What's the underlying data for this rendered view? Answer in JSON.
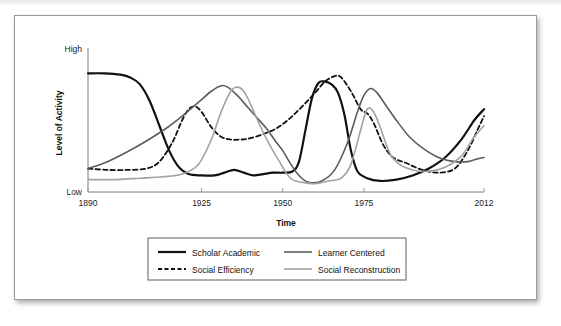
{
  "figure": {
    "background_color": "#ffffff",
    "border_color": "#9b9b9b"
  },
  "chart_data": {
    "type": "line",
    "title": "",
    "xlabel": "Time",
    "ylabel": "Level of Activity",
    "grid": false,
    "legend_position": "bottom",
    "x_tick_labels": [
      "1890",
      "1925",
      "1950",
      "1975",
      "2012"
    ],
    "x_tick_values": [
      1890,
      1925,
      1950,
      1975,
      2012
    ],
    "xlim": [
      1890,
      2012
    ],
    "y_tick_labels": [
      "Low",
      "High"
    ],
    "ylim": [
      0,
      1
    ],
    "y_axis_note": "qualitative scale from Low to High",
    "series": [
      {
        "name": "Scholar Academic",
        "color": "#111111",
        "style": "solid",
        "width": 2.2,
        "x": [
          1890,
          1895,
          1900,
          1903,
          1906,
          1909,
          1912,
          1915,
          1918,
          1921,
          1925,
          1929,
          1932,
          1935,
          1938,
          1941,
          1944,
          1947,
          1950,
          1953,
          1955,
          1957,
          1959,
          1961,
          1963,
          1965,
          1967,
          1969,
          1971,
          1973,
          1976,
          1980,
          1985,
          1990,
          1995,
          2000,
          2005,
          2009,
          2012
        ],
        "y": [
          0.86,
          0.86,
          0.85,
          0.83,
          0.78,
          0.66,
          0.48,
          0.3,
          0.18,
          0.13,
          0.12,
          0.12,
          0.14,
          0.16,
          0.14,
          0.12,
          0.13,
          0.14,
          0.14,
          0.15,
          0.22,
          0.45,
          0.68,
          0.79,
          0.8,
          0.78,
          0.72,
          0.56,
          0.3,
          0.15,
          0.1,
          0.08,
          0.09,
          0.12,
          0.17,
          0.25,
          0.38,
          0.52,
          0.6
        ]
      },
      {
        "name": "Social Efficiency",
        "color": "#111111",
        "style": "dashed",
        "width": 1.8,
        "x": [
          1890,
          1896,
          1902,
          1908,
          1912,
          1916,
          1919,
          1921,
          1923,
          1925,
          1928,
          1931,
          1934,
          1937,
          1940,
          1944,
          1948,
          1952,
          1956,
          1960,
          1963,
          1966,
          1968,
          1971,
          1974,
          1976,
          1978,
          1981,
          1984,
          1988,
          1993,
          1998,
          2003,
          2007,
          2010,
          2012
        ],
        "y": [
          0.17,
          0.16,
          0.16,
          0.17,
          0.22,
          0.36,
          0.52,
          0.6,
          0.62,
          0.58,
          0.47,
          0.4,
          0.38,
          0.38,
          0.39,
          0.42,
          0.46,
          0.53,
          0.62,
          0.72,
          0.8,
          0.84,
          0.83,
          0.73,
          0.6,
          0.57,
          0.5,
          0.34,
          0.25,
          0.21,
          0.16,
          0.14,
          0.17,
          0.3,
          0.45,
          0.55
        ]
      },
      {
        "name": "Learner Centered",
        "color": "#5c5c5c",
        "style": "solid",
        "width": 1.6,
        "x": [
          1890,
          1896,
          1902,
          1908,
          1914,
          1919,
          1924,
          1928,
          1931,
          1933,
          1936,
          1939,
          1942,
          1945,
          1948,
          1950,
          1952,
          1955,
          1958,
          1962,
          1966,
          1970,
          1973,
          1975,
          1977,
          1979,
          1982,
          1985,
          1989,
          1993,
          1998,
          2003,
          2007,
          2010,
          2012
        ],
        "y": [
          0.17,
          0.22,
          0.29,
          0.37,
          0.46,
          0.55,
          0.65,
          0.73,
          0.77,
          0.76,
          0.7,
          0.62,
          0.54,
          0.46,
          0.36,
          0.3,
          0.22,
          0.12,
          0.07,
          0.08,
          0.16,
          0.36,
          0.58,
          0.7,
          0.75,
          0.72,
          0.62,
          0.52,
          0.4,
          0.32,
          0.25,
          0.22,
          0.22,
          0.24,
          0.25
        ]
      },
      {
        "name": "Social Reconstruction",
        "color": "#a2a2a2",
        "style": "solid",
        "width": 1.6,
        "x": [
          1890,
          1898,
          1906,
          1913,
          1919,
          1924,
          1928,
          1931,
          1934,
          1936,
          1938,
          1940,
          1943,
          1946,
          1949,
          1951,
          1953,
          1956,
          1960,
          1964,
          1968,
          1971,
          1974,
          1976,
          1978,
          1980,
          1983,
          1986,
          1990,
          1995,
          2000,
          2005,
          2009,
          2012
        ],
        "y": [
          0.09,
          0.09,
          0.1,
          0.11,
          0.13,
          0.2,
          0.38,
          0.58,
          0.73,
          0.76,
          0.73,
          0.64,
          0.48,
          0.34,
          0.22,
          0.14,
          0.09,
          0.07,
          0.06,
          0.08,
          0.1,
          0.2,
          0.45,
          0.6,
          0.58,
          0.47,
          0.28,
          0.2,
          0.16,
          0.15,
          0.18,
          0.26,
          0.4,
          0.48
        ]
      }
    ]
  },
  "legend": {
    "entries": [
      {
        "label": "Scholar Academic",
        "color": "#111111",
        "style": "solid",
        "width": 2.2
      },
      {
        "label": "Social Efficiency",
        "color": "#111111",
        "style": "dashed",
        "width": 1.8
      },
      {
        "label": "Learner Centered",
        "color": "#5c5c5c",
        "style": "solid",
        "width": 1.6
      },
      {
        "label": "Social Reconstruction",
        "color": "#a2a2a2",
        "style": "solid",
        "width": 1.6
      }
    ]
  }
}
